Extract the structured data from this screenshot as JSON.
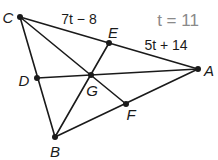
{
  "diagram": {
    "given": "t = 11",
    "segments_labels": {
      "CE": "7t − 8",
      "EA": "5t + 14"
    },
    "points": {
      "A": {
        "label": "A",
        "x": 198,
        "y": 69
      },
      "B": {
        "label": "B",
        "x": 55,
        "y": 137
      },
      "C": {
        "label": "C",
        "x": 20,
        "y": 17
      },
      "D": {
        "label": "D",
        "x": 37,
        "y": 78
      },
      "E": {
        "label": "E",
        "x": 109,
        "y": 43
      },
      "F": {
        "label": "F",
        "x": 126,
        "y": 104
      },
      "G": {
        "label": "G",
        "x": 91,
        "y": 75
      }
    },
    "colors": {
      "stroke": "#1a1a1a",
      "given_text": "#8a8a8a"
    }
  }
}
